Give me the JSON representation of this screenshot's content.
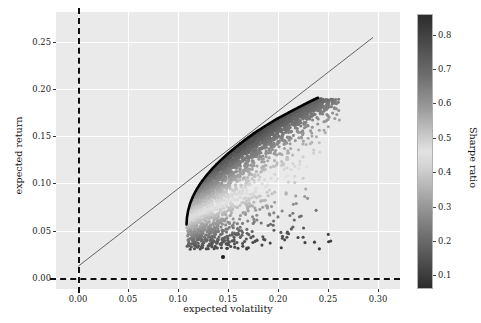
{
  "chart_data": {
    "type": "scatter",
    "title": "",
    "xlabel": "expected volatility",
    "ylabel": "expected return",
    "xlim": [
      -0.022,
      0.322
    ],
    "ylim": [
      -0.012,
      0.282
    ],
    "xticks": [
      "0.00",
      "0.05",
      "0.10",
      "0.15",
      "0.20",
      "0.25",
      "0.30"
    ],
    "xtick_values": [
      0.0,
      0.05,
      0.1,
      0.15,
      0.2,
      0.25,
      0.3
    ],
    "yticks": [
      "0.00",
      "0.05",
      "0.10",
      "0.15",
      "0.20",
      "0.25"
    ],
    "ytick_values": [
      0.0,
      0.05,
      0.1,
      0.15,
      0.2,
      0.25
    ],
    "grid": true,
    "grid_color": "#ffffff",
    "axes_facecolor": "#eaeaea",
    "colorbar": {
      "label": "Sharpe ratio",
      "ticks": [
        "0.1",
        "0.2",
        "0.3",
        "0.4",
        "0.5",
        "0.6",
        "0.7",
        "0.8"
      ],
      "tick_values": [
        0.1,
        0.2,
        0.3,
        0.4,
        0.5,
        0.6,
        0.7,
        0.8
      ],
      "vmin": 0.06,
      "vmax": 0.86,
      "orientation": "vertical",
      "position": "right"
    },
    "reference_lines": [
      {
        "name": "zero-volatility-line",
        "orientation": "vertical",
        "value": 0.0,
        "style": "dashed",
        "color": "#101010",
        "width": 2.2
      },
      {
        "name": "zero-return-line",
        "orientation": "horizontal",
        "value": 0.0,
        "style": "dashed",
        "color": "#101010",
        "width": 2.2
      }
    ],
    "series": [
      {
        "name": "capital-market-line",
        "type": "line",
        "color": "#555555",
        "width": 0.9,
        "points": [
          [
            0.0,
            0.012
          ],
          [
            0.295,
            0.255
          ]
        ]
      },
      {
        "name": "efficient-frontier",
        "type": "line",
        "color": "#000000",
        "width": 2.6,
        "points": [
          [
            0.1085,
            0.0565
          ],
          [
            0.109,
            0.064
          ],
          [
            0.1102,
            0.0715
          ],
          [
            0.1122,
            0.079
          ],
          [
            0.115,
            0.0865
          ],
          [
            0.1188,
            0.094
          ],
          [
            0.1234,
            0.1015
          ],
          [
            0.1288,
            0.109
          ],
          [
            0.135,
            0.1165
          ],
          [
            0.142,
            0.124
          ],
          [
            0.1498,
            0.1315
          ],
          [
            0.1582,
            0.139
          ],
          [
            0.1673,
            0.1465
          ],
          [
            0.177,
            0.154
          ],
          [
            0.1872,
            0.161
          ],
          [
            0.198,
            0.168
          ],
          [
            0.2092,
            0.1745
          ],
          [
            0.221,
            0.181
          ],
          [
            0.233,
            0.1875
          ],
          [
            0.24,
            0.191
          ]
        ]
      },
      {
        "name": "random-portfolios",
        "type": "scatter",
        "marker": "o",
        "size": 3,
        "colormap": "viridis-grayscale",
        "color_by": "Sharpe ratio",
        "n_points": 3000,
        "x_range": [
          0.105,
          0.255
        ],
        "y_range": [
          0.02,
          0.19
        ],
        "description": "dense cloud of random portfolios bounded on the upper-left by the efficient frontier, fanning out to the lower-right; color encodes Sharpe ratio, darkest near the frontier"
      },
      {
        "name": "outlier-portfolio",
        "type": "scatter",
        "points": [
          [
            0.145,
            0.022
          ]
        ],
        "color": "#1a1a1a",
        "size": 4
      }
    ]
  }
}
